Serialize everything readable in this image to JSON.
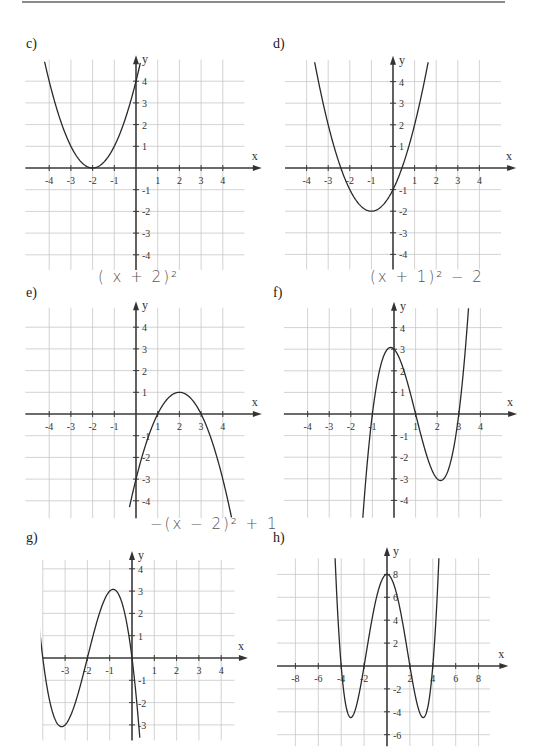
{
  "page": {
    "top_rule": true
  },
  "panels": [
    {
      "id": "c",
      "label": "c)",
      "label_pos": [
        26,
        36
      ],
      "handwriting": null
    },
    {
      "id": "d",
      "label": "d)",
      "label_pos": [
        273,
        36
      ],
      "handwriting": null
    },
    {
      "id": "e",
      "label": "e)",
      "label_pos": [
        26,
        285
      ],
      "handwriting": {
        "text": "( x + 2)²",
        "pos": [
          98,
          268
        ]
      }
    },
    {
      "id": "f",
      "label": "f)",
      "label_pos": [
        273,
        285
      ],
      "handwriting": {
        "text": "(x + 1)² − 2",
        "pos": [
          370,
          268
        ]
      }
    },
    {
      "id": "g",
      "label": "g)",
      "label_pos": [
        26,
        530
      ],
      "handwriting": {
        "text": "−(x − 2)² + 1",
        "pos": [
          150,
          515
        ]
      }
    },
    {
      "id": "h",
      "label": "h)",
      "label_pos": [
        273,
        530
      ],
      "handwriting": null
    }
  ],
  "chart_data": [
    {
      "id": "c",
      "type": "line",
      "title": "c)",
      "xlabel": "x",
      "ylabel": "y",
      "origin_px": [
        136,
        168
      ],
      "unit_px": 21.7,
      "tick_step": 1,
      "grid": {
        "x": [
          -5.1,
          5
        ],
        "y": [
          -4.7,
          5.0
        ],
        "vlines": [
          -4,
          -3,
          -2,
          -1,
          1,
          2,
          3,
          4
        ],
        "hlines": [
          -4,
          -3,
          -2,
          -1,
          1,
          2,
          3,
          4
        ]
      },
      "axis_x_end": 5.8,
      "axis_y_top": 5.2,
      "xticks": [
        "-4",
        "-3",
        "-2",
        "-1",
        "1",
        "2",
        "3",
        "4"
      ],
      "xtick_values": [
        -4,
        -3,
        -2,
        -1,
        1,
        2,
        3,
        4
      ],
      "yticks": [
        "4",
        "3",
        "2",
        "1",
        "-1",
        "-2",
        "-3",
        "-4"
      ],
      "ytick_values": [
        4,
        3,
        2,
        1,
        -1,
        -2,
        -3,
        -4
      ],
      "function": "(x+2)^2",
      "poly": [
        4,
        4,
        1
      ],
      "domain": [
        -4.3,
        0.2
      ],
      "ylim": [
        -4.7,
        4.9
      ],
      "points": [
        [
          -4,
          4
        ],
        [
          -3,
          1
        ],
        [
          -2,
          0
        ],
        [
          -1,
          1
        ],
        [
          0,
          4
        ]
      ]
    },
    {
      "id": "d",
      "type": "line",
      "title": "d)",
      "xlabel": "x",
      "ylabel": "y",
      "origin_px": [
        393,
        168
      ],
      "unit_px": 21.6,
      "tick_step": 1,
      "grid": {
        "x": [
          -5.0,
          5.0
        ],
        "y": [
          -4.7,
          5.0
        ],
        "vlines": [
          -4,
          -3,
          -2,
          -1,
          1,
          2,
          3,
          4
        ],
        "hlines": [
          -4,
          -3,
          -2,
          -1,
          1,
          2,
          3,
          4
        ]
      },
      "axis_x_end": 5.7,
      "axis_y_top": 5.2,
      "xticks": [
        "-4",
        "-3",
        "-2",
        "-1",
        "1",
        "2",
        "3",
        "4"
      ],
      "xtick_values": [
        -4,
        -3,
        -2,
        -1,
        1,
        2,
        3,
        4
      ],
      "yticks": [
        "4",
        "3",
        "2",
        "1",
        "-1",
        "-2",
        "-3",
        "-4"
      ],
      "ytick_values": [
        4,
        3,
        2,
        1,
        -1,
        -2,
        -3,
        -4
      ],
      "function": "(x+1)^2-2",
      "poly": [
        -1,
        2,
        1
      ],
      "domain": [
        -3.7,
        1.7
      ],
      "ylim": [
        -4.7,
        4.9
      ],
      "points": [
        [
          -3,
          2
        ],
        [
          -2,
          -1
        ],
        [
          -1,
          -2
        ],
        [
          0,
          -1
        ],
        [
          1,
          2
        ]
      ]
    },
    {
      "id": "e",
      "type": "line",
      "title": "e)",
      "xlabel": "x",
      "ylabel": "y",
      "origin_px": [
        136,
        414
      ],
      "unit_px": 21.7,
      "tick_step": 1,
      "grid": {
        "x": [
          -5.1,
          5.0
        ],
        "y": [
          -4.8,
          4.9
        ],
        "vlines": [
          -4,
          -3,
          -2,
          -1,
          1,
          2,
          3,
          4
        ],
        "hlines": [
          -4,
          -3,
          -2,
          -1,
          1,
          2,
          3,
          4
        ]
      },
      "axis_x_end": 5.8,
      "axis_y_top": 5.2,
      "xticks": [
        "-4",
        "-3",
        "-2",
        "-1",
        "1",
        "2",
        "3",
        "4"
      ],
      "xtick_values": [
        -4,
        -3,
        -2,
        -1,
        1,
        2,
        3,
        4
      ],
      "yticks": [
        "4",
        "3",
        "2",
        "1",
        "-1",
        "-2",
        "-3",
        "-4"
      ],
      "ytick_values": [
        4,
        3,
        2,
        1,
        -1,
        -2,
        -3,
        -4
      ],
      "function": "-(x-2)^2+1",
      "poly": [
        -3,
        4,
        -1
      ],
      "domain": [
        -0.3,
        4.4
      ],
      "ylim": [
        -4.8,
        4.9
      ],
      "points": [
        [
          0,
          -3
        ],
        [
          1,
          0
        ],
        [
          2,
          1
        ],
        [
          3,
          0
        ],
        [
          4,
          -3
        ]
      ]
    },
    {
      "id": "f",
      "type": "line",
      "title": "f)",
      "xlabel": "x",
      "ylabel": "y",
      "origin_px": [
        394,
        414
      ],
      "unit_px": 21.6,
      "tick_step": 1,
      "grid": {
        "x": [
          -5.1,
          5.0
        ],
        "y": [
          -4.8,
          4.9
        ],
        "vlines": [
          -4,
          -3,
          -2,
          -1,
          1,
          2,
          3,
          4
        ],
        "hlines": [
          -4,
          -3,
          -2,
          -1,
          1,
          2,
          3,
          4
        ]
      },
      "axis_x_end": 5.7,
      "axis_y_top": 5.2,
      "xticks": [
        "-4",
        "-3",
        "-2",
        "-1",
        "1",
        "2",
        "3",
        "4"
      ],
      "xtick_values": [
        -4,
        -3,
        -2,
        -1,
        1,
        2,
        3,
        4
      ],
      "yticks": [
        "4",
        "3",
        "2",
        "1",
        "-1",
        "-2",
        "-3",
        "-4"
      ],
      "ytick_values": [
        4,
        3,
        2,
        1,
        -1,
        -2,
        -3,
        -4
      ],
      "function": "(x+1)(x-1)(x-3)",
      "poly": [
        3,
        -1,
        -3,
        1
      ],
      "domain": [
        -1.5,
        3.5
      ],
      "ylim": [
        -4.8,
        4.9
      ],
      "points": [
        [
          -1,
          0
        ],
        [
          0,
          3
        ],
        [
          1,
          0
        ],
        [
          2.15,
          -3.08
        ],
        [
          3,
          0
        ]
      ]
    },
    {
      "id": "g",
      "type": "line",
      "title": "g)",
      "xlabel": "x",
      "ylabel": "y",
      "origin_px": [
        132,
        658
      ],
      "unit_px": 22.3,
      "tick_step": 1,
      "grid": {
        "x": [
          -4.0,
          4.6
        ],
        "y": [
          -3.7,
          4.4
        ],
        "vlines": [
          -4,
          -3,
          -2,
          -1,
          1,
          2,
          3,
          4
        ],
        "hlines": [
          -3,
          -2,
          -1,
          1,
          2,
          3,
          4
        ]
      },
      "axis_x_end": 5.2,
      "axis_y_top": 4.8,
      "xticks": [
        "-3",
        "-2",
        "-1",
        "1",
        "2",
        "3",
        "4"
      ],
      "xtick_values": [
        -3,
        -2,
        -1,
        1,
        2,
        3,
        4
      ],
      "yticks": [
        "4",
        "3",
        "2",
        "1",
        "-1",
        "-2",
        "-3"
      ],
      "ytick_values": [
        4,
        3,
        2,
        1,
        -1,
        -2,
        -3
      ],
      "function": "-x(x+2)(x+4)",
      "poly": [
        0,
        -8,
        -6,
        -1
      ],
      "domain": [
        -4.4,
        0.35
      ],
      "ylim": [
        -3.7,
        4.4
      ],
      "points": [
        [
          -4,
          0
        ],
        [
          -3.15,
          -3.08
        ],
        [
          -2,
          0
        ],
        [
          -0.85,
          3.08
        ],
        [
          0,
          0
        ]
      ]
    },
    {
      "id": "h",
      "type": "line",
      "title": "h)",
      "xlabel": "x",
      "ylabel": "y",
      "origin_px": [
        387,
        666
      ],
      "unit_px": 11.45,
      "tick_step": 2,
      "grid": {
        "x": [
          -9.6,
          9.0
        ],
        "y": [
          -7.0,
          9.4
        ],
        "vlines": [
          -8,
          -6,
          -4,
          -2,
          2,
          4,
          6,
          8
        ],
        "hlines": [
          -6,
          -4,
          -2,
          2,
          4,
          6,
          8
        ]
      },
      "axis_x_end": 10.6,
      "axis_y_top": 10.4,
      "xticks": [
        "-8",
        "-6",
        "-4",
        "-2",
        "2",
        "4",
        "6",
        "8"
      ],
      "xtick_values": [
        -8,
        -6,
        -4,
        -2,
        2,
        4,
        6,
        8
      ],
      "yticks": [
        "8",
        "6",
        "4",
        "2",
        "-2",
        "-4",
        "-6"
      ],
      "ytick_values": [
        8,
        6,
        4,
        2,
        -2,
        -4,
        -6
      ],
      "function": "(x^2-4)(x^2-16)/8",
      "poly": [
        8,
        0,
        -2.5,
        0,
        0.125
      ],
      "domain": [
        -4.6,
        4.6
      ],
      "ylim": [
        -7.0,
        9.4
      ],
      "points": [
        [
          -4,
          0
        ],
        [
          -3.16,
          -4.5
        ],
        [
          -2,
          0
        ],
        [
          0,
          8
        ],
        [
          2,
          0
        ],
        [
          3.16,
          -4.5
        ],
        [
          4,
          0
        ]
      ]
    }
  ]
}
